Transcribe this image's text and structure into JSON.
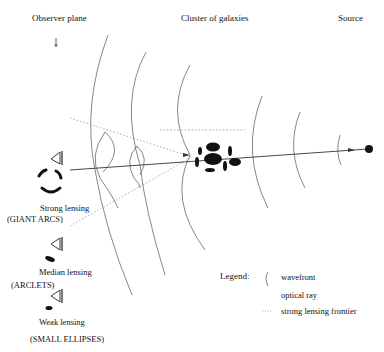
{
  "header": {
    "observer_plane": "Observer plane",
    "cluster": "Cluster of galaxies",
    "source": "Source"
  },
  "observers": [
    {
      "regime": "Strong lensing",
      "image_type": "(GIANT ARCS)"
    },
    {
      "regime": "Median lensing",
      "image_type": "(ARCLETS)"
    },
    {
      "regime": "Weak lensing",
      "image_type": "(SMALL  ELLIPSES)"
    }
  ],
  "legend": {
    "title": "Legend:",
    "items": [
      {
        "symbol": "arc",
        "label": "wavefront"
      },
      {
        "symbol": "solid-line",
        "label": "optical ray"
      },
      {
        "symbol": "dotted-line",
        "label": "strong lensing frontier"
      }
    ]
  },
  "colors": {
    "ink": "#111111",
    "line": "#444444",
    "dotted": "#888888",
    "background": "#ffffff"
  }
}
